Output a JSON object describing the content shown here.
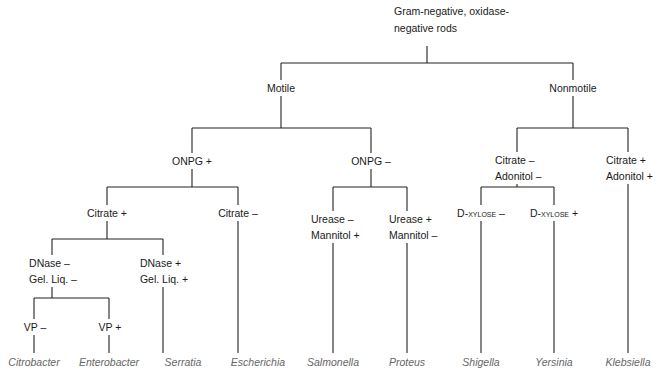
{
  "diagram": {
    "type": "identification-flowchart",
    "root": {
      "label_line1": "Gram-negative, oxidase-",
      "label_line2": "negative rods"
    },
    "nodes": {
      "motile": "Motile",
      "nonmotile": "Nonmotile",
      "onpg_pos": "ONPG +",
      "onpg_neg": "ONPG –",
      "citrate_pos": "Citrate +",
      "citrate_neg": "Citrate –",
      "dnase_neg_1": "DNase –",
      "dnase_neg_2": "Gel. Liq. –",
      "dnase_pos_1": "DNase +",
      "dnase_pos_2": "Gel. Liq. +",
      "vp_neg": "VP –",
      "vp_pos": "VP +",
      "urease_neg_1": "Urease –",
      "urease_neg_2": "Mannitol +",
      "urease_pos_1": "Urease +",
      "urease_pos_2": "Mannitol –",
      "cit_adon_neg_1": "Citrate –",
      "cit_adon_neg_2": "Adonitol –",
      "cit_adon_pos_1": "Citrate +",
      "cit_adon_pos_2": "Adonitol +",
      "dxylose_neg": "D-xylose –",
      "dxylose_pos": "D-xylose +"
    },
    "genera": [
      {
        "name": "Citrobacter",
        "x": 34
      },
      {
        "name": "Enterobacter",
        "x": 109
      },
      {
        "name": "Serratia",
        "x": 183
      },
      {
        "name": "Escherichia",
        "x": 258
      },
      {
        "name": "Salmonella",
        "x": 333
      },
      {
        "name": "Proteus",
        "x": 407
      },
      {
        "name": "Shigella",
        "x": 481
      },
      {
        "name": "Yersinia",
        "x": 554
      },
      {
        "name": "Klebsiella",
        "x": 628
      }
    ],
    "colors": {
      "line": "#222222",
      "text": "#1a1a1a",
      "genus_text": "#666666"
    }
  }
}
